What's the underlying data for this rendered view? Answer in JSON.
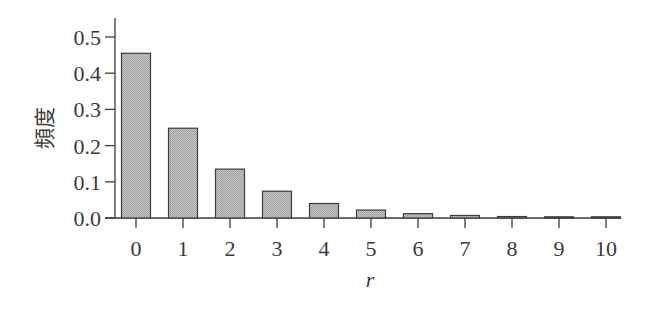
{
  "chart_data": {
    "type": "bar",
    "title": "",
    "xlabel": "r",
    "ylabel": "頻度",
    "categories": [
      "0",
      "1",
      "2",
      "3",
      "4",
      "5",
      "6",
      "7",
      "8",
      "9",
      "10"
    ],
    "values": [
      0.455,
      0.248,
      0.135,
      0.074,
      0.04,
      0.022,
      0.012,
      0.007,
      0.004,
      0.002,
      0.001
    ],
    "ylim": [
      0,
      0.55
    ],
    "yticks": [
      0.0,
      0.1,
      0.2,
      0.3,
      0.4,
      0.5
    ],
    "ytick_labels": [
      "0.0",
      "0.1",
      "0.2",
      "0.3",
      "0.4",
      "0.5"
    ],
    "grid": false,
    "legend": null
  },
  "style": {
    "bar_fill": "#b9b9b9",
    "bar_stroke": "#3c3c3c",
    "axis_color": "#3c3c3c"
  }
}
